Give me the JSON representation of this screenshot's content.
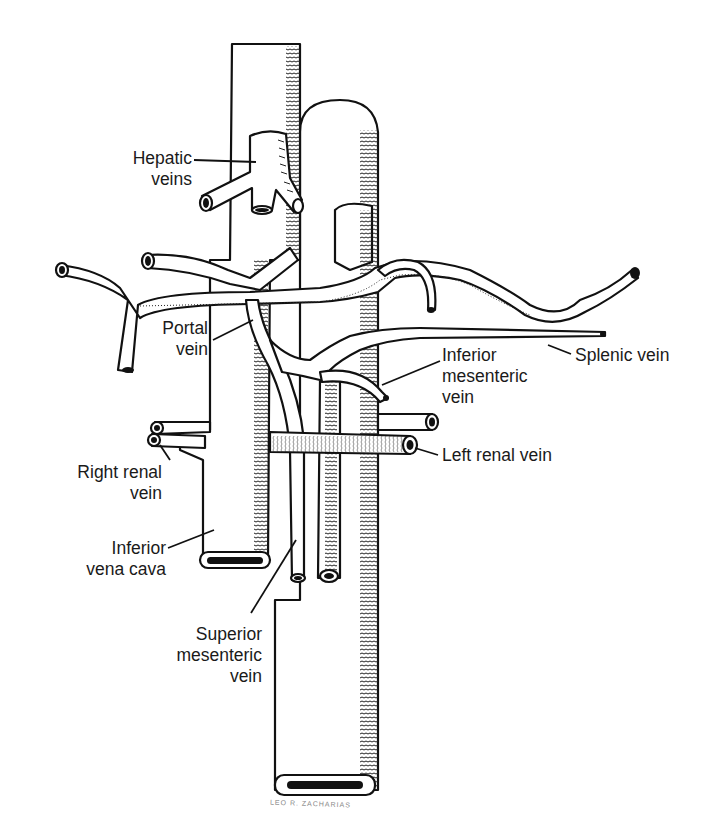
{
  "diagram": {
    "colors": {
      "ink": "#111111",
      "background": "#ffffff",
      "text": "#1a1a1a"
    },
    "labels": [
      {
        "id": "hepatic-veins",
        "text": "Hepatic\nveins"
      },
      {
        "id": "portal-vein",
        "text": "Portal\nvein"
      },
      {
        "id": "splenic-vein",
        "text": "Splenic vein"
      },
      {
        "id": "inferior-mesenteric-vein",
        "text": "Inferior\nmesenteric\nvein"
      },
      {
        "id": "right-renal-vein",
        "text": "Right renal\nvein"
      },
      {
        "id": "left-renal-vein",
        "text": "Left renal vein"
      },
      {
        "id": "inferior-vena-cava",
        "text": "Inferior\nvena cava"
      },
      {
        "id": "superior-mesenteric-vein",
        "text": "Superior\nmesenteric\nvein"
      }
    ],
    "signature": "LEO R. ZACHARIAS"
  }
}
